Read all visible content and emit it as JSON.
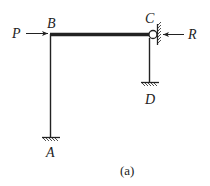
{
  "diagram": {
    "type": "structural frame",
    "caption": "(a)",
    "labels": {
      "P": "P",
      "B": "B",
      "C": "C",
      "R": "R",
      "D": "D",
      "A": "A"
    },
    "members": [
      {
        "name": "AB",
        "type": "column",
        "from": "A",
        "to": "B"
      },
      {
        "name": "BC",
        "type": "beam (rigid, bold)",
        "from": "B",
        "to": "C"
      },
      {
        "name": "CD",
        "type": "column",
        "from": "C",
        "to": "D"
      }
    ],
    "supports": [
      {
        "node": "A",
        "type": "fixed"
      },
      {
        "node": "D",
        "type": "fixed"
      },
      {
        "node": "C",
        "type": "roller against vertical wall"
      }
    ],
    "loads": [
      {
        "name": "P",
        "node": "B",
        "direction": "right"
      },
      {
        "name": "R",
        "node": "C",
        "direction": "left"
      }
    ],
    "colors": {
      "line": "#222222",
      "background": "#ffffff"
    }
  }
}
